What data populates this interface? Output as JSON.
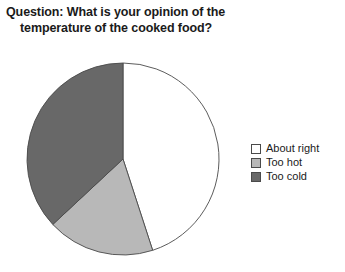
{
  "chart_data": {
    "type": "pie",
    "title": "Question: What is your opinion of the temperature of the cooked food?",
    "title_line1": "Question: What is your opinion of the",
    "title_line2": "temperature of the cooked food?",
    "categories": [
      "About right",
      "Too hot",
      "Too cold"
    ],
    "values": [
      45,
      18,
      37
    ],
    "value_unit": "percent",
    "colors": [
      "#ffffff",
      "#b8b8b8",
      "#686868"
    ],
    "outline_color": "#4a4a4a",
    "start_angle_deg": 0,
    "direction": "clockwise",
    "legend_position": "right",
    "grid": false,
    "xlabel": "",
    "ylabel": "",
    "slices": [
      {
        "label": "About right",
        "value": 45,
        "color": "#ffffff",
        "start_deg": 0,
        "end_deg": 162
      },
      {
        "label": "Too hot",
        "value": 18,
        "color": "#b8b8b8",
        "start_deg": 162,
        "end_deg": 227
      },
      {
        "label": "Too cold",
        "value": 37,
        "color": "#686868",
        "start_deg": 227,
        "end_deg": 360
      }
    ]
  },
  "legend": {
    "items": [
      {
        "label": "About right",
        "color": "#ffffff"
      },
      {
        "label": "Too hot",
        "color": "#b8b8b8"
      },
      {
        "label": "Too cold",
        "color": "#686868"
      }
    ]
  }
}
